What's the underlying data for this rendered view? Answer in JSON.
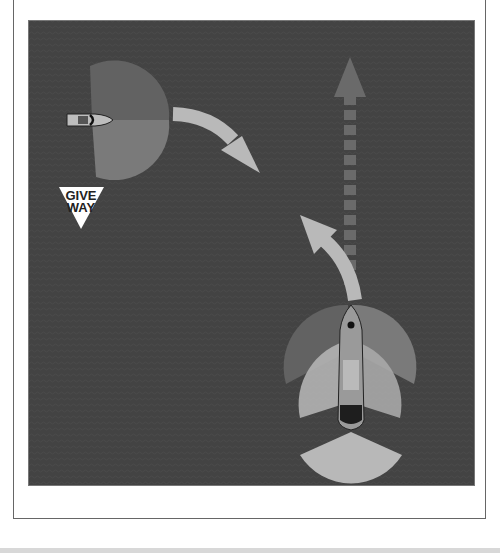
{
  "diagram": {
    "sign": {
      "line1": "GIVE",
      "line2": "WAY"
    },
    "colors": {
      "water": "#434343",
      "sector_dark": "#626262",
      "sector_mid": "#7a7a7a",
      "sector_light": "#b4b4b4",
      "arrow": "#b9b9b9",
      "dashed_arrow": "#6a6a6a",
      "frame_border": "#666666"
    },
    "elements": [
      {
        "name": "give-way-vessel",
        "position": "left-upper"
      },
      {
        "name": "stand-on-vessel",
        "position": "right-lower"
      },
      {
        "name": "curved-arrow-give-way",
        "direction": "right-down"
      },
      {
        "name": "curved-arrow-stand-on",
        "direction": "up-left"
      },
      {
        "name": "dashed-course-arrow",
        "direction": "up"
      }
    ]
  }
}
